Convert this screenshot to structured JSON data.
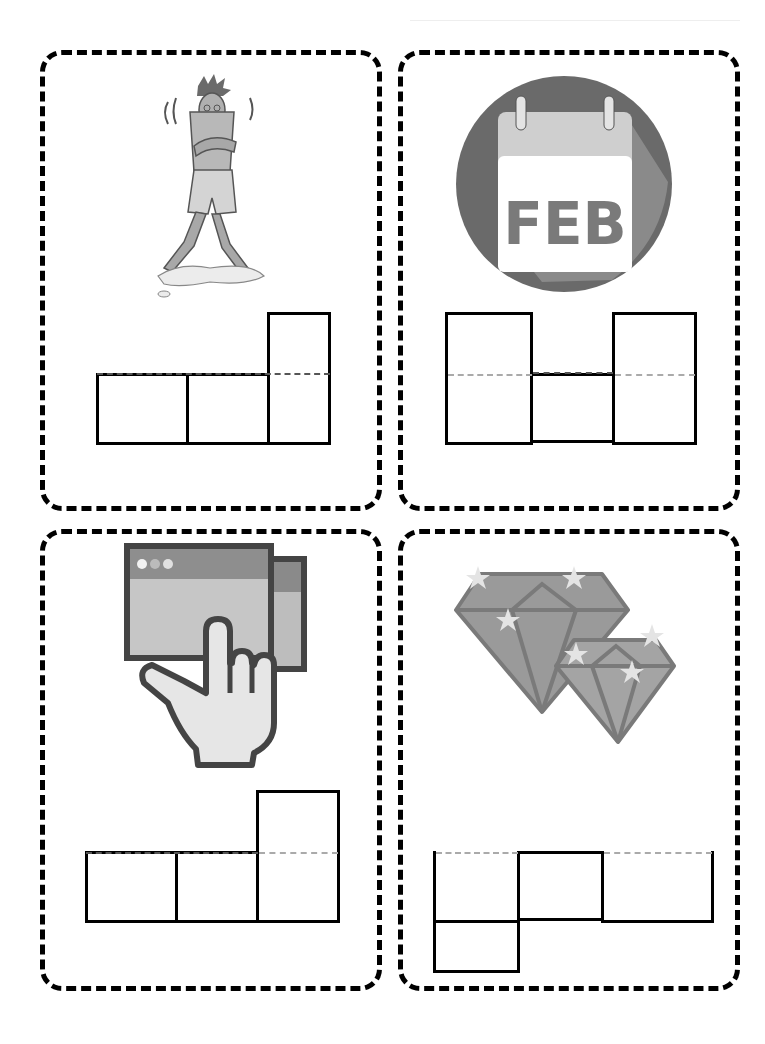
{
  "worksheet": {
    "title": "Word shape boxes worksheet",
    "colors": {
      "border": "#000000",
      "illustration_dark": "#6a6a6a",
      "illustration_mid": "#9a9a9a",
      "illustration_light": "#d0d0d0"
    },
    "cards": [
      {
        "id": "card-1",
        "picture": "shivering-person-icon",
        "picture_description": "person shivering in shorts standing on a puddle",
        "letter_boxes": [
          "short",
          "short",
          "tall"
        ]
      },
      {
        "id": "card-2",
        "picture": "calendar-feb-icon",
        "picture_text": "FEB",
        "picture_description": "calendar page showing FEB in a dark circle",
        "letter_boxes": [
          "tall",
          "short",
          "tall"
        ]
      },
      {
        "id": "card-3",
        "picture": "hand-touching-screen-icon",
        "picture_description": "hand with finger pointing at a browser window",
        "letter_boxes": [
          "short",
          "short",
          "tall"
        ]
      },
      {
        "id": "card-4",
        "picture": "gems-icon",
        "picture_description": "two sparkling diamonds",
        "letter_boxes": [
          "descender",
          "short",
          "wide-short"
        ]
      }
    ]
  }
}
